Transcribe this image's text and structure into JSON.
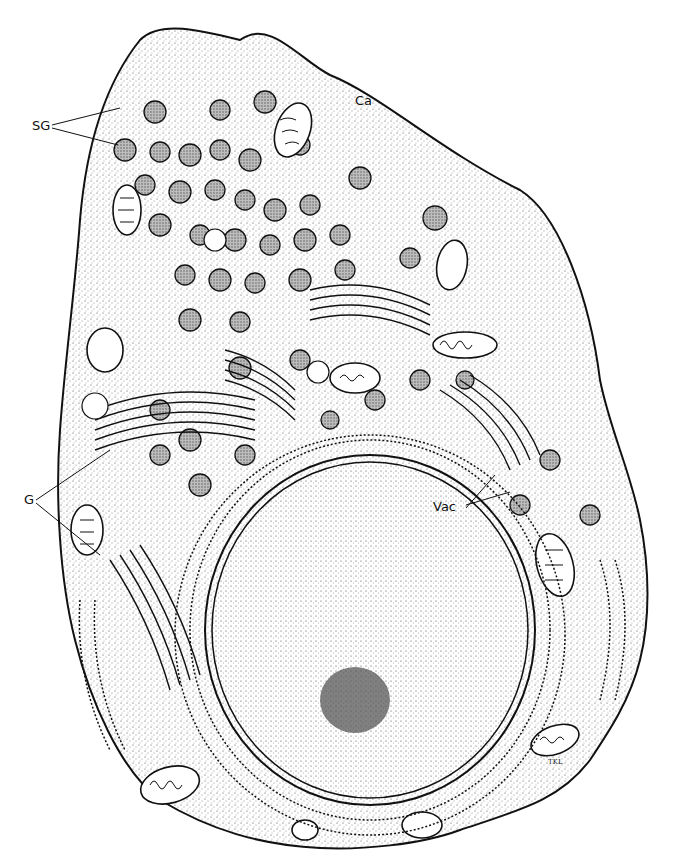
{
  "figure": {
    "colors": {
      "ink": "#111111",
      "stipple": "#cfcfcf",
      "background": "#ffffff",
      "granule": "#9a9a9a",
      "nucleus": "#ececec",
      "nucleolus": "#555555"
    },
    "labels": [
      {
        "id": "sg",
        "text": "SG",
        "x": 32,
        "y": 127
      },
      {
        "id": "ca",
        "text": "Ca",
        "x": 357,
        "y": 101
      },
      {
        "id": "g",
        "text": "G",
        "x": 24,
        "y": 497
      },
      {
        "id": "vac",
        "text": "Vac",
        "x": 435,
        "y": 507
      }
    ],
    "signature": "TKL"
  }
}
